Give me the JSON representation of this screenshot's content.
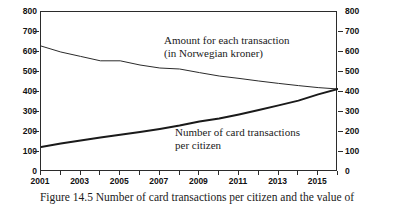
{
  "caption": "Figure 14.5 Number of card transactions per citizen and the value of",
  "annotations": {
    "amount_line1": "Amount for each transaction",
    "amount_line2": "(in Norwegian kroner)",
    "count_line1": "Number of card transactions",
    "count_line2": "per citizen"
  },
  "chart_data": {
    "type": "line",
    "title": "",
    "xlabel": "",
    "ylabel": "",
    "ylim": [
      0,
      800
    ],
    "xlim": [
      2001,
      2016
    ],
    "grid": false,
    "legend": "inline-annotations",
    "y_ticks": [
      0,
      100,
      200,
      300,
      400,
      500,
      600,
      700,
      800
    ],
    "y_ticks_right": [
      0,
      100,
      200,
      300,
      400,
      500,
      600,
      700,
      800
    ],
    "x_ticks": [
      2001,
      2002,
      2003,
      2004,
      2005,
      2006,
      2007,
      2008,
      2009,
      2010,
      2011,
      2012,
      2013,
      2014,
      2015,
      2016
    ],
    "x_tick_labels": [
      "2001",
      "",
      "2003",
      "",
      "2005",
      "",
      "2007",
      "",
      "2009",
      "",
      "2011",
      "",
      "2013",
      "",
      "2015",
      ""
    ],
    "x": [
      2001,
      2002,
      2003,
      2004,
      2005,
      2006,
      2007,
      2008,
      2009,
      2010,
      2011,
      2012,
      2013,
      2014,
      2015,
      2016
    ],
    "series": [
      {
        "name": "Amount for each transaction (in Norwegian kroner)",
        "color": "#2b2b2b",
        "width": 1,
        "values": [
          630,
          600,
          578,
          556,
          556,
          535,
          520,
          515,
          497,
          480,
          468,
          455,
          443,
          432,
          422,
          415
        ]
      },
      {
        "name": "Number of card transactions per citizen",
        "color": "#1a1a1a",
        "width": 2,
        "values": [
          125,
          142,
          158,
          172,
          186,
          200,
          215,
          232,
          252,
          268,
          288,
          310,
          333,
          357,
          388,
          415
        ]
      }
    ]
  }
}
